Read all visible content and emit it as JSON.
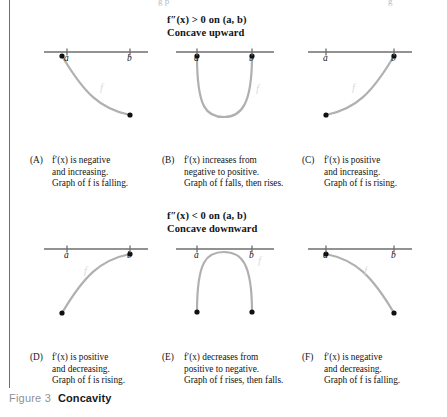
{
  "figure": {
    "number_label": "Figure 3",
    "title": "Concavity",
    "top_clipped_fragments": [
      "g  p",
      "g"
    ]
  },
  "sections": [
    {
      "id": "concave-upward",
      "condition": "f″(x) > 0 on (a, b)",
      "condition_parts": {
        "fn": "f",
        "primes": "″",
        "var": "(x)",
        "rel": "> 0 on",
        "interval": "(a, b)"
      },
      "name": "Concave upward"
    },
    {
      "id": "concave-downward",
      "condition": "f″(x) < 0 on (a, b)",
      "condition_parts": {
        "fn": "f",
        "primes": "″",
        "var": "(x)",
        "rel": "< 0 on",
        "interval": "(a, b)"
      },
      "name": "Concave downward"
    }
  ],
  "axis": {
    "left_tick_label": "a",
    "right_tick_label": "b"
  },
  "panels": [
    {
      "tag": "(A)",
      "lines": [
        "f′(x) is negative",
        "and increasing.",
        "Graph of f is falling."
      ],
      "line1_pre": "f′(x)",
      "line1_post": " is negative",
      "line3_pre": "Graph of ",
      "line3_italic": "f",
      "line3_post": " is falling.",
      "curve": "decreasing-concave-up",
      "endpoints": {
        "left": "high",
        "right": "low"
      }
    },
    {
      "tag": "(B)",
      "lines": [
        "f′(x) increases from",
        "negative to positive.",
        "Graph of f falls, then rises."
      ],
      "line1_pre": "f′(x)",
      "line1_post": " increases from",
      "line3_pre": "Graph of ",
      "line3_italic": "f",
      "line3_post": " falls, then rises.",
      "curve": "u-shape-concave-up",
      "endpoints": {
        "left": "high",
        "right": "high"
      }
    },
    {
      "tag": "(C)",
      "lines": [
        "f′(x) is positive",
        "and increasing.",
        "Graph of f is rising."
      ],
      "line1_pre": "f′(x)",
      "line1_post": " is positive",
      "line3_pre": "Graph of ",
      "line3_italic": "f",
      "line3_post": " is rising.",
      "curve": "increasing-concave-up",
      "endpoints": {
        "left": "low",
        "right": "high"
      }
    },
    {
      "tag": "(D)",
      "lines": [
        "f′(x) is positive",
        "and decreasing.",
        "Graph of f is rising."
      ],
      "line1_pre": "f′(x)",
      "line1_post": " is positive",
      "line3_pre": "Graph of ",
      "line3_italic": "f",
      "line3_post": " is rising.",
      "curve": "increasing-concave-down",
      "endpoints": {
        "left": "low",
        "right": "high"
      }
    },
    {
      "tag": "(E)",
      "lines": [
        "f′(x) decreases from",
        "positive to negative.",
        "Graph of f rises, then falls."
      ],
      "line1_pre": "f′(x)",
      "line1_post": " decreases from",
      "line3_pre": "Graph of ",
      "line3_italic": "f",
      "line3_post": " rises, then falls.",
      "curve": "arch-concave-down",
      "endpoints": {
        "left": "low",
        "right": "low"
      }
    },
    {
      "tag": "(F)",
      "lines": [
        "f′(x) is negative",
        "and decreasing.",
        "Graph of f is falling."
      ],
      "line1_pre": "f′(x)",
      "line1_post": " is negative",
      "line3_pre": "Graph of ",
      "line3_italic": "f",
      "line3_post": " is falling.",
      "curve": "decreasing-concave-down",
      "endpoints": {
        "left": "high",
        "right": "low"
      }
    }
  ],
  "curve_labels": {
    "text": "f",
    "note": "faint italic f label on each curve"
  },
  "colors": {
    "curve": "#b0b0b0",
    "axis": "#6e6e6e",
    "point": "#111111",
    "text": "#141414",
    "figure_number": "#8e9199",
    "rule": "#6e6e6e"
  }
}
